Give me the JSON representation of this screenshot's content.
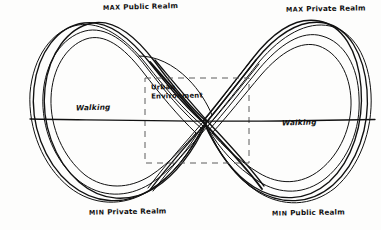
{
  "figure": {
    "type": "hand-drawn-diagram",
    "background_color": "#fdfdfc",
    "ink_color": "#111111",
    "dash_color": "#5d5d5d"
  },
  "labels": {
    "max_public_realm": "MAX Public Realm",
    "max_private_realm": "MAX Private Realm",
    "min_private_realm": "MIN Private Realm",
    "min_public_realm": "MIN Public Realm",
    "walking_left": "Walking",
    "walking_right": "Walking",
    "urban_environment_line1": "Urban",
    "urban_environment_line2": "Environment"
  },
  "label_parts": {
    "max_public_kw": "MAX",
    "max_public_rest": "Public Realm",
    "max_private_kw": "MAX",
    "max_private_rest": "Private Realm",
    "min_private_kw": "MIN",
    "min_private_rest": "Private Realm",
    "min_public_kw": "MIN",
    "min_public_rest": "Public Realm"
  },
  "geometry": {
    "canvas_width": 381,
    "canvas_height": 230,
    "horizontal_axis_y": 119,
    "horizontal_axis_x_start": 30,
    "horizontal_axis_x_end": 375,
    "crossing_point_x": 205,
    "crossing_point_y": 122,
    "dashed_box_x": 145,
    "dashed_box_y": 78,
    "dashed_box_width": 104,
    "dashed_box_height": 85,
    "left_loop_center_x": 118,
    "right_loop_center_x": 292,
    "loop_top_y": 22,
    "loop_bottom_y": 201,
    "stroke_pass_count": 4
  }
}
